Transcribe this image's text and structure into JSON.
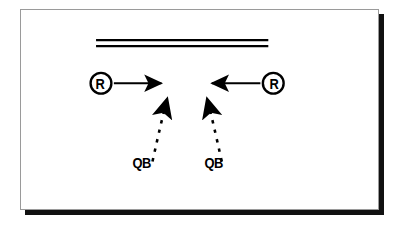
{
  "diagram": {
    "background_color": "#ffffff",
    "ink_color": "#000000",
    "frame_color": "#9a9a9a",
    "shadow_color": "#111111",
    "line_of_scrimmage": {
      "name": "line-of-scrimmage",
      "style": "double-solid-horizontal",
      "x_start": 95,
      "x_end": 249,
      "y_top": 39,
      "y_bottom": 45
    },
    "players": [
      {
        "id": "receiver-left",
        "label": "R",
        "role": "receiver",
        "marker": "circled-letter",
        "x": 91,
        "y": 74
      },
      {
        "id": "receiver-right",
        "label": "R",
        "role": "receiver",
        "marker": "circled-letter",
        "x": 252,
        "y": 74
      },
      {
        "id": "quarterback-left",
        "label": "QB",
        "role": "quarterback",
        "marker": "text",
        "x": 128,
        "y": 154
      },
      {
        "id": "quarterback-right",
        "label": "QB",
        "role": "quarterback",
        "marker": "text",
        "x": 203,
        "y": 154
      }
    ],
    "routes": [
      {
        "id": "route-receiver-left",
        "from": "receiver-left",
        "to": "convergence-left",
        "style": "solid",
        "arrow": "end",
        "direction": "right"
      },
      {
        "id": "route-receiver-right",
        "from": "receiver-right",
        "to": "convergence-right",
        "style": "solid",
        "arrow": "end",
        "direction": "left"
      },
      {
        "id": "route-qb-left",
        "from": "quarterback-left",
        "to": "convergence-left",
        "style": "dashed",
        "arrow": "end",
        "direction": "up-right"
      },
      {
        "id": "route-qb-right",
        "from": "quarterback-right",
        "to": "convergence-right",
        "style": "dashed",
        "arrow": "end",
        "direction": "up-left"
      }
    ]
  }
}
